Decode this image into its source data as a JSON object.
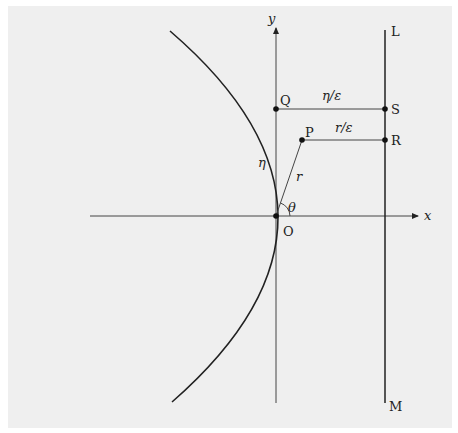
{
  "figure": {
    "colors": {
      "background": "#efefef",
      "ink": "#222222",
      "frame": "#ffffff"
    }
  },
  "axes": {
    "x_label": "x",
    "y_label": "y"
  },
  "points": {
    "origin": "O",
    "q": "Q",
    "p": "P",
    "s": "S",
    "r": "R"
  },
  "directrix": {
    "top_label": "L",
    "bottom_label": "M"
  },
  "annotations": {
    "eta": "η",
    "r": "r",
    "theta": "θ",
    "eta_over_eps": "η/ε",
    "r_over_eps": "r/ε"
  }
}
